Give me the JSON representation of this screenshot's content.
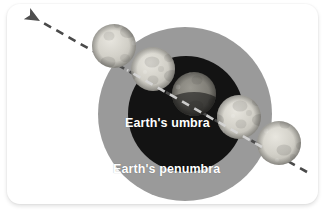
{
  "figure": {
    "background_color": "#ffffff",
    "card": {
      "background_color": "#ffffff",
      "corner_radius_px": 13
    }
  },
  "labels": {
    "umbra": "Earth's umbra",
    "penumbra": "Earth's penumbra",
    "text_color": "#ffffff"
  },
  "shadow_regions": [
    {
      "name": "penumbra",
      "label": "Earth's penumbra",
      "fill": "#9a9a9a",
      "center_x": 178,
      "center_y": 110,
      "radius": 87
    },
    {
      "name": "umbra",
      "label": "Earth's umbra",
      "fill": "#131313",
      "center_x": 179,
      "center_y": 110,
      "radius": 58
    }
  ],
  "moon_path": {
    "direction": "up-left",
    "style": "dashed",
    "dash_color": "#4a4a4a",
    "dash_color_on_dark": "#d8d8d8",
    "arrow_color": "#4f4f4f",
    "start_x": 300,
    "start_y": 168,
    "end_x": 33,
    "end_y": 17
  },
  "moons": [
    {
      "index": 1,
      "position": "outside shadow (right, full)",
      "center_x": 272,
      "center_y": 139,
      "radius": 22,
      "lit_fraction": 1.0,
      "fill": "#d8d6cf"
    },
    {
      "index": 2,
      "position": "entering umbra (right)",
      "center_x": 232,
      "center_y": 113,
      "radius": 22,
      "lit_fraction": 0.45,
      "fill": "#c9c7c0"
    },
    {
      "index": 3,
      "position": "totality (center of umbra)",
      "center_x": 187,
      "center_y": 90,
      "radius": 22,
      "lit_fraction": 0.3,
      "fill": "#7c7a74"
    },
    {
      "index": 4,
      "position": "leaving umbra (left)",
      "center_x": 146,
      "center_y": 65,
      "radius": 22,
      "lit_fraction": 0.45,
      "fill": "#c9c7c0"
    },
    {
      "index": 5,
      "position": "outside shadow (left, full)",
      "center_x": 107,
      "center_y": 42,
      "radius": 22,
      "lit_fraction": 1.0,
      "fill": "#cfcdc6"
    }
  ]
}
